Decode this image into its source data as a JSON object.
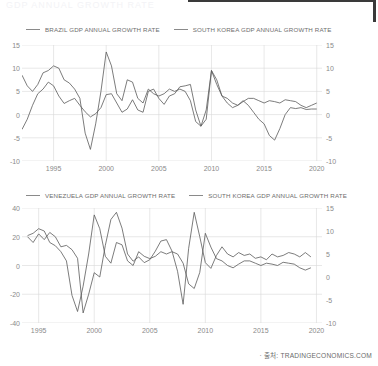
{
  "masthead_ghost": "GDP ANNUAL GROWTH RATE",
  "footer": {
    "source_text": "· 출처: TRADINGECONOMICS.COM"
  },
  "colors": {
    "line": "#5a5a5a",
    "grid": "#d8d8d8",
    "axis_text": "#8a8a8a",
    "frame": "#3a3a3a"
  },
  "chart_data": [
    {
      "type": "line",
      "title": "",
      "xlabel": "",
      "ylabel": "",
      "grid": true,
      "legend_position": "top-left",
      "xlim": [
        1992.0,
        2020.5
      ],
      "xticks": [
        "1995",
        "2000",
        "2005",
        "2010",
        "2015",
        "2020"
      ],
      "xtick_values": [
        1995,
        2000,
        2005,
        2010,
        2015,
        2020
      ],
      "ylim": [
        -10,
        15
      ],
      "yticks_left": [
        "15",
        "10",
        "5",
        "0",
        "-5",
        "-10"
      ],
      "ytick_values_left": [
        15,
        10,
        5,
        0,
        -5,
        -10
      ],
      "yticks_right": [
        "15",
        "10",
        "5",
        "0",
        "-5",
        "-10"
      ],
      "ytick_values_right": [
        15,
        10,
        5,
        0,
        -5,
        -10
      ],
      "series": [
        {
          "name": "BRAZIL GDP ANNUAL GROWTH RATE",
          "axis": "left",
          "x": [
            1992.0,
            1992.5,
            1993.0,
            1993.5,
            1994.0,
            1994.5,
            1995.0,
            1995.5,
            1996.0,
            1996.5,
            1997.0,
            1997.5,
            1998.0,
            1998.5,
            1999.0,
            1999.5,
            2000.0,
            2000.5,
            2001.0,
            2001.5,
            2002.0,
            2002.5,
            2003.0,
            2003.5,
            2004.0,
            2004.5,
            2005.0,
            2005.5,
            2006.0,
            2006.5,
            2007.0,
            2007.5,
            2008.0,
            2008.5,
            2009.0,
            2009.5,
            2010.0,
            2010.5,
            2011.0,
            2011.5,
            2012.0,
            2012.5,
            2013.0,
            2013.5,
            2014.0,
            2014.5,
            2015.0,
            2015.5,
            2016.0,
            2016.5,
            2017.0,
            2017.5,
            2018.0,
            2018.5,
            2019.0,
            2019.5,
            2020.0
          ],
          "values": [
            -3.2,
            -1.0,
            2.0,
            4.5,
            5.5,
            7.0,
            6.2,
            4.0,
            2.4,
            3.0,
            3.5,
            2.0,
            0.6,
            -0.5,
            0.2,
            1.5,
            4.3,
            4.5,
            2.5,
            0.5,
            1.2,
            3.2,
            1.0,
            0.5,
            5.0,
            5.5,
            3.5,
            2.2,
            4.0,
            4.5,
            6.0,
            6.2,
            6.5,
            1.0,
            -2.5,
            -1.0,
            9.5,
            7.5,
            4.0,
            2.5,
            1.5,
            2.0,
            3.0,
            2.0,
            0.5,
            -1.0,
            -2.0,
            -4.5,
            -5.5,
            -3.0,
            0.0,
            1.5,
            1.3,
            1.5,
            1.1,
            1.2,
            1.2
          ]
        },
        {
          "name": "SOUTH KOREA GDP ANNUAL GROWTH RATE",
          "axis": "left",
          "x": [
            1992.0,
            1992.5,
            1993.0,
            1993.5,
            1994.0,
            1994.5,
            1995.0,
            1995.5,
            1996.0,
            1996.5,
            1997.0,
            1997.5,
            1998.0,
            1998.5,
            1999.0,
            1999.5,
            2000.0,
            2000.5,
            2001.0,
            2001.5,
            2002.0,
            2002.5,
            2003.0,
            2003.5,
            2004.0,
            2004.5,
            2005.0,
            2005.5,
            2006.0,
            2006.5,
            2007.0,
            2007.5,
            2008.0,
            2008.5,
            2009.0,
            2009.5,
            2010.0,
            2010.5,
            2011.0,
            2011.5,
            2012.0,
            2012.5,
            2013.0,
            2013.5,
            2014.0,
            2014.5,
            2015.0,
            2015.5,
            2016.0,
            2016.5,
            2017.0,
            2017.5,
            2018.0,
            2018.5,
            2019.0,
            2019.5,
            2020.0
          ],
          "values": [
            8.5,
            6.2,
            5.0,
            6.5,
            9.0,
            9.5,
            10.5,
            10.0,
            7.5,
            6.8,
            5.5,
            3.5,
            -4.0,
            -7.5,
            -2.0,
            5.0,
            13.5,
            10.5,
            4.5,
            3.0,
            7.5,
            7.0,
            3.5,
            2.5,
            5.5,
            4.5,
            4.0,
            4.5,
            5.5,
            5.0,
            5.5,
            5.0,
            3.0,
            -1.5,
            -2.5,
            1.0,
            9.5,
            6.5,
            4.0,
            3.5,
            2.5,
            2.0,
            2.8,
            3.5,
            3.5,
            3.0,
            2.5,
            3.0,
            2.8,
            2.5,
            3.2,
            3.0,
            2.8,
            2.0,
            1.5,
            2.0,
            2.5
          ]
        }
      ]
    },
    {
      "type": "line",
      "title": "",
      "xlabel": "",
      "ylabel": "",
      "grid": true,
      "legend_position": "top-left",
      "xlim": [
        1993.5,
        2020.5
      ],
      "xticks": [
        "1995",
        "2000",
        "2005",
        "2010",
        "2015",
        "2020"
      ],
      "xtick_values": [
        1995,
        2000,
        2005,
        2010,
        2015,
        2020
      ],
      "ylim_left": [
        -40,
        40
      ],
      "yticks_left": [
        "40",
        "20",
        "0",
        "-20",
        "-40"
      ],
      "ytick_values_left": [
        40,
        20,
        0,
        -20,
        -40
      ],
      "ylim_right": [
        -10,
        15
      ],
      "yticks_right": [
        "15",
        "10",
        "5",
        "0",
        "-5",
        "-10"
      ],
      "ytick_values_right": [
        15,
        10,
        5,
        0,
        -5,
        -10
      ],
      "series": [
        {
          "name": "VENEZUELA GDP ANNUAL GROWTH RATE",
          "axis": "left",
          "x": [
            1994.0,
            1994.5,
            1995.0,
            1995.5,
            1996.0,
            1996.5,
            1997.0,
            1997.5,
            1998.0,
            1998.5,
            1999.0,
            1999.5,
            2000.0,
            2000.5,
            2001.0,
            2001.5,
            2002.0,
            2002.5,
            2003.0,
            2003.5,
            2004.0,
            2004.5,
            2005.0,
            2005.5,
            2006.0,
            2006.5,
            2007.0,
            2007.5,
            2008.0,
            2008.5,
            2009.0,
            2009.5,
            2010.0,
            2010.5,
            2011.0,
            2011.5,
            2012.0,
            2012.5,
            2013.0,
            2013.5,
            2014.0,
            2014.5,
            2015.0,
            2015.5,
            2016.0,
            2016.5,
            2017.0,
            2017.5,
            2018.0,
            2018.5,
            2019.0,
            2019.5
          ],
          "values": [
            20.0,
            16.0,
            22.0,
            18.0,
            23.0,
            20.0,
            13.0,
            14.0,
            11.0,
            5.0,
            -33.0,
            -20.0,
            -5.0,
            -8.0,
            14.0,
            32.0,
            37.0,
            26.0,
            8.0,
            3.0,
            6.0,
            2.0,
            4.0,
            10.0,
            17.0,
            18.0,
            10.0,
            -4.0,
            -27.0,
            12.0,
            37.0,
            20.0,
            2.0,
            -2.0,
            7.0,
            13.0,
            8.0,
            6.0,
            9.0,
            7.0,
            8.0,
            5.0,
            6.0,
            4.0,
            8.0,
            6.0,
            7.0,
            9.0,
            8.0,
            6.0,
            9.0,
            6.0
          ]
        },
        {
          "name": "SOUTH KOREA GDP ANNUAL GROWTH RATE",
          "axis": "right",
          "x": [
            1994.0,
            1994.5,
            1995.0,
            1995.5,
            1996.0,
            1996.5,
            1997.0,
            1997.5,
            1998.0,
            1998.5,
            1999.0,
            1999.5,
            2000.0,
            2000.5,
            2001.0,
            2001.5,
            2002.0,
            2002.5,
            2003.0,
            2003.5,
            2004.0,
            2004.5,
            2005.0,
            2005.5,
            2006.0,
            2006.5,
            2007.0,
            2007.5,
            2008.0,
            2008.5,
            2009.0,
            2009.5,
            2010.0,
            2010.5,
            2011.0,
            2011.5,
            2012.0,
            2012.5,
            2013.0,
            2013.5,
            2014.0,
            2014.5,
            2015.0,
            2015.5,
            2016.0,
            2016.5,
            2017.0,
            2017.5,
            2018.0,
            2018.5,
            2019.0,
            2019.5
          ],
          "values": [
            9.0,
            9.5,
            10.5,
            10.0,
            7.5,
            6.8,
            5.5,
            3.5,
            -4.0,
            -7.5,
            -2.0,
            5.0,
            13.5,
            10.5,
            4.5,
            3.0,
            7.5,
            7.0,
            3.5,
            2.5,
            5.5,
            4.5,
            4.0,
            4.5,
            5.5,
            5.0,
            5.5,
            5.0,
            3.0,
            -1.5,
            -2.5,
            1.0,
            9.5,
            6.5,
            4.0,
            3.5,
            2.5,
            2.0,
            2.8,
            3.5,
            3.5,
            3.0,
            2.5,
            3.0,
            2.8,
            2.5,
            3.2,
            3.0,
            2.8,
            2.0,
            1.5,
            2.0
          ]
        }
      ]
    }
  ],
  "charts": [
    {
      "legend": [
        {
          "label": "BRAZIL GDP ANNUAL GROWTH RATE"
        },
        {
          "label": "SOUTH KOREA GDP ANNUAL GROWTH RATE"
        }
      ]
    },
    {
      "legend": [
        {
          "label": "VENEZUELA GDP ANNUAL GROWTH RATE"
        },
        {
          "label": "SOUTH KOREA GDP ANNUAL GROWTH RATE"
        }
      ]
    }
  ]
}
